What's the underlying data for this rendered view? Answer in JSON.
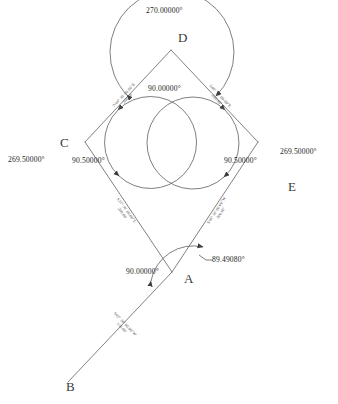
{
  "drawing": {
    "title": "Parcel angle and bearing diagram",
    "background_color": "#ffffff",
    "line_color": "#555555",
    "text_color": "#242424"
  },
  "points": [
    {
      "id": "D",
      "label": "D",
      "x": 171,
      "y": 50,
      "label_x": 180,
      "label_y": 34
    },
    {
      "id": "C",
      "label": "C",
      "x": 85,
      "y": 142,
      "label_x": 56,
      "label_y": 143
    },
    {
      "id": "E",
      "label": "E",
      "x": 258,
      "y": 142,
      "label_x": 289,
      "label_y": 180
    },
    {
      "id": "A",
      "label": "A",
      "x": 172,
      "y": 272,
      "label_x": 184,
      "label_y": 277
    },
    {
      "id": "B",
      "label": "B",
      "x": 68,
      "y": 382,
      "label_x": 68,
      "label_y": 384
    }
  ],
  "angles": {
    "d_interior": "90.00000°",
    "d_reflex": "270.00000°",
    "c_interior": "90.50000°",
    "c_reflex": "269.50000°",
    "e_interior": "90.50000°",
    "e_reflex": "269.50000°",
    "a_interior": "90.00000°",
    "a_leader": "89.49080°"
  },
  "edges": [
    {
      "id": "cd",
      "from": "C",
      "to": "D",
      "bearing": "N44° 30' 00.00\"E",
      "distance": "200.00'",
      "text_x": 126,
      "text_y": 97,
      "rotation": -46.9
    },
    {
      "id": "de",
      "from": "D",
      "to": "E",
      "bearing": "S46° 30' 00.00\"E",
      "distance": "200.00'",
      "text_x": 218,
      "text_y": 98,
      "rotation": 46.9
    },
    {
      "id": "ca",
      "from": "C",
      "to": "A",
      "bearing": "S33° 30' 00.00\"E",
      "distance": "200.00'",
      "text_x": 124,
      "text_y": 212,
      "rotation": 53.5
    },
    {
      "id": "ea",
      "from": "E",
      "to": "A",
      "bearing": "S36° 30' 00.00\"W",
      "distance": "200.00'",
      "text_x": 219,
      "text_y": 212,
      "rotation": -56.9
    },
    {
      "id": "ab",
      "from": "A",
      "to": "B",
      "bearing": "S43° 30' 00.00\"W",
      "distance": "150.00'",
      "text_x": 123,
      "text_y": 326,
      "rotation": 46.6
    }
  ]
}
